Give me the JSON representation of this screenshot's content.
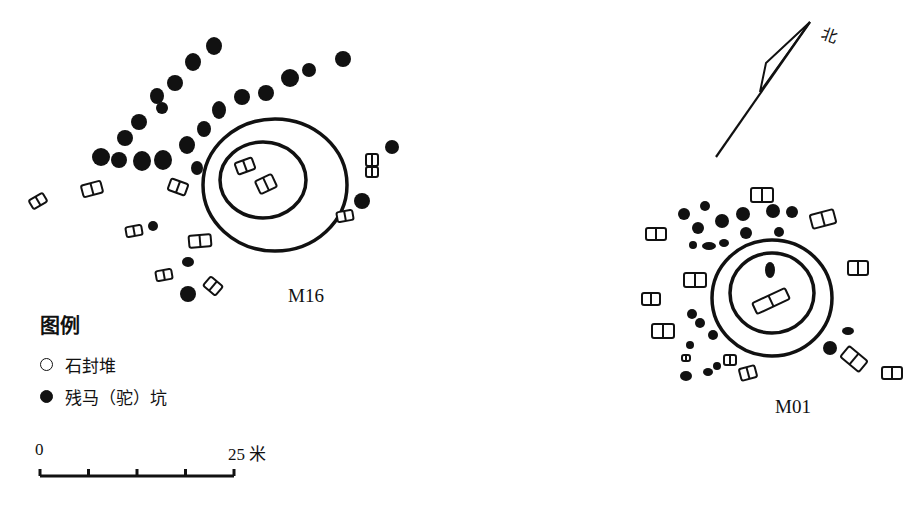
{
  "sites": [
    {
      "id": "M16",
      "label": "M16",
      "label_pos": [
        288,
        285
      ],
      "outer_ring": {
        "cx": 275,
        "cy": 185,
        "rx": 72,
        "ry": 66
      },
      "inner_ring": {
        "cx": 263,
        "cy": 180,
        "rx": 43,
        "ry": 38
      },
      "pits": [
        [
          214,
          46,
          8,
          9
        ],
        [
          193,
          62,
          8,
          9
        ],
        [
          175,
          83,
          8,
          8
        ],
        [
          157,
          96,
          7,
          8
        ],
        [
          162,
          108,
          6,
          6
        ],
        [
          139,
          122,
          8,
          8
        ],
        [
          125,
          138,
          8,
          8
        ],
        [
          101,
          157,
          9,
          9
        ],
        [
          119,
          160,
          8,
          8
        ],
        [
          142,
          161,
          9,
          10
        ],
        [
          163,
          160,
          9,
          10
        ],
        [
          187,
          145,
          8,
          9
        ],
        [
          204,
          129,
          7,
          8
        ],
        [
          219,
          110,
          7,
          9
        ],
        [
          242,
          97,
          8,
          8
        ],
        [
          266,
          93,
          8,
          8
        ],
        [
          290,
          78,
          9,
          9
        ],
        [
          309,
          70,
          7,
          7
        ],
        [
          343,
          59,
          8,
          8
        ],
        [
          197,
          168,
          6,
          7
        ],
        [
          392,
          147,
          7,
          7
        ],
        [
          362,
          201,
          8,
          8
        ],
        [
          153,
          226,
          5,
          5
        ],
        [
          188,
          262,
          6,
          5
        ],
        [
          188,
          294,
          8,
          8
        ]
      ],
      "mounds": [
        [
          38,
          201,
          8,
          5,
          -30
        ],
        [
          92,
          189,
          10,
          6,
          -15
        ],
        [
          178,
          187,
          9,
          6,
          20
        ],
        [
          245,
          166,
          9,
          6,
          -20
        ],
        [
          266,
          184,
          9,
          7,
          -25
        ],
        [
          134,
          231,
          8,
          5,
          -10
        ],
        [
          200,
          241,
          11,
          6,
          -5
        ],
        [
          164,
          275,
          8,
          5,
          -10
        ],
        [
          213,
          286,
          8,
          6,
          40
        ],
        [
          345,
          216,
          8,
          5,
          -10
        ],
        [
          372,
          160,
          6,
          6,
          0
        ],
        [
          372,
          172,
          6,
          5,
          0
        ]
      ]
    },
    {
      "id": "M01",
      "label": "M01",
      "label_pos": [
        775,
        398
      ],
      "outer_ring": {
        "cx": 772,
        "cy": 298,
        "rx": 60,
        "ry": 58
      },
      "inner_ring": {
        "cx": 772,
        "cy": 293,
        "rx": 42,
        "ry": 40
      },
      "pits": [
        [
          684,
          214,
          6,
          6
        ],
        [
          705,
          206,
          5,
          5
        ],
        [
          698,
          228,
          6,
          6
        ],
        [
          722,
          221,
          7,
          7
        ],
        [
          743,
          214,
          7,
          7
        ],
        [
          773,
          211,
          7,
          7
        ],
        [
          792,
          212,
          6,
          6
        ],
        [
          746,
          233,
          6,
          6
        ],
        [
          709,
          246,
          7,
          4
        ],
        [
          724,
          243,
          5,
          4
        ],
        [
          693,
          245,
          4,
          4
        ],
        [
          779,
          232,
          5,
          5
        ],
        [
          770,
          270,
          5,
          8
        ],
        [
          692,
          314,
          5,
          5
        ],
        [
          700,
          323,
          5,
          5
        ],
        [
          713,
          335,
          5,
          5
        ],
        [
          690,
          345,
          4,
          4
        ],
        [
          686,
          376,
          6,
          5
        ],
        [
          708,
          372,
          5,
          4
        ],
        [
          717,
          366,
          4,
          4
        ],
        [
          848,
          331,
          6,
          4
        ],
        [
          830,
          348,
          7,
          7
        ]
      ],
      "mounds": [
        [
          762,
          195,
          11,
          7,
          0
        ],
        [
          823,
          219,
          12,
          7,
          -15
        ],
        [
          656,
          234,
          10,
          6,
          0
        ],
        [
          858,
          268,
          10,
          7,
          0
        ],
        [
          695,
          280,
          11,
          7,
          0
        ],
        [
          651,
          299,
          9,
          6,
          0
        ],
        [
          663,
          331,
          11,
          7,
          0
        ],
        [
          686,
          358,
          4,
          3,
          0
        ],
        [
          730,
          360,
          6,
          5,
          0
        ],
        [
          748,
          373,
          8,
          6,
          -15
        ],
        [
          854,
          359,
          12,
          7,
          40
        ],
        [
          892,
          373,
          10,
          6,
          0
        ],
        [
          771,
          301,
          18,
          6,
          -25
        ]
      ]
    }
  ],
  "legend": {
    "title": "图例",
    "items": [
      {
        "symbol": "open-circle",
        "label": "石封堆"
      },
      {
        "symbol": "filled-circle",
        "label": "残马（驼）坑"
      }
    ]
  },
  "scale_bar": {
    "start_label": "0",
    "end_label": "25 米",
    "ticks": 5,
    "x0": 40,
    "x1": 234,
    "y": 476
  },
  "north_arrow": {
    "label": "北",
    "line": [
      716,
      157,
      810,
      22
    ],
    "head": [
      [
        810,
        22
      ],
      [
        766,
        63
      ],
      [
        760,
        92
      ]
    ]
  }
}
